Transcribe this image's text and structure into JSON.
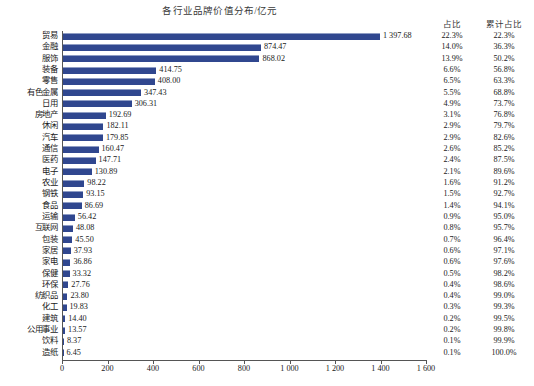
{
  "chart_data": {
    "type": "bar",
    "orientation": "horizontal",
    "title": "各行业品牌价值分布/亿元",
    "xlabel": "",
    "ylabel": "",
    "xlim": [
      0,
      1600
    ],
    "xticks": [
      "0",
      "200",
      "400",
      "600",
      "800",
      "1 000",
      "1 200",
      "1 400",
      "1 600"
    ],
    "xtick_values": [
      0,
      200,
      400,
      600,
      800,
      1000,
      1200,
      1400,
      1600
    ],
    "grid": false,
    "legend": "none",
    "bar_color": "#30478f",
    "columns": {
      "pct_header": "占比",
      "cum_header": "累计占比"
    },
    "categories": [
      "贸易",
      "金融",
      "服饰",
      "装备",
      "零售",
      "有色金属",
      "日用",
      "房地产",
      "休闲",
      "汽车",
      "通信",
      "医药",
      "电子",
      "农业",
      "钢铁",
      "食品",
      "运输",
      "互联网",
      "包装",
      "家居",
      "家电",
      "保健",
      "环保",
      "纺织品",
      "化工",
      "建筑",
      "公用事业",
      "饮料",
      "造纸"
    ],
    "values": [
      1397.68,
      874.47,
      868.02,
      414.75,
      408.0,
      347.43,
      306.31,
      192.69,
      182.11,
      179.85,
      160.47,
      147.71,
      130.89,
      98.22,
      93.15,
      86.69,
      56.42,
      48.08,
      45.5,
      37.93,
      36.86,
      33.32,
      27.76,
      23.8,
      19.83,
      14.4,
      13.57,
      8.37,
      6.45
    ],
    "value_labels": [
      "1 397.68",
      "874.47",
      "868.02",
      "414.75",
      "408.00",
      "347.43",
      "306.31",
      "192.69",
      "182.11",
      "179.85",
      "160.47",
      "147.71",
      "130.89",
      "98.22",
      "93.15",
      "86.69",
      "56.42",
      "48.08",
      "45.50",
      "37.93",
      "36.86",
      "33.32",
      "27.76",
      "23.80",
      "19.83",
      "14.40",
      "13.57",
      "8.37",
      "6.45"
    ],
    "pct": [
      "22.3%",
      "14.0%",
      "13.9%",
      "6.6%",
      "6.5%",
      "5.5%",
      "4.9%",
      "3.1%",
      "2.9%",
      "2.9%",
      "2.6%",
      "2.4%",
      "2.1%",
      "1.6%",
      "1.5%",
      "1.4%",
      "0.9%",
      "0.8%",
      "0.7%",
      "0.6%",
      "0.6%",
      "0.5%",
      "0.4%",
      "0.4%",
      "0.3%",
      "0.2%",
      "0.2%",
      "0.1%",
      "0.1%"
    ],
    "cumulative_pct": [
      "22.3%",
      "36.3%",
      "50.2%",
      "56.8%",
      "63.3%",
      "68.8%",
      "73.7%",
      "76.8%",
      "79.7%",
      "82.6%",
      "85.2%",
      "87.5%",
      "89.6%",
      "91.2%",
      "92.7%",
      "94.1%",
      "95.0%",
      "95.7%",
      "96.4%",
      "97.1%",
      "97.6%",
      "98.2%",
      "98.6%",
      "99.0%",
      "99.3%",
      "99.5%",
      "99.8%",
      "99.9%",
      "100.0%"
    ]
  }
}
